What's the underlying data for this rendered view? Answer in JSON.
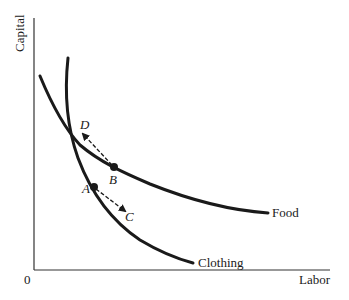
{
  "diagram": {
    "title": "",
    "y_axis_label": "Capital",
    "x_axis_label": "Labor",
    "origin_label": "0",
    "curves": [
      {
        "name": "Clothing",
        "label": "Clothing"
      },
      {
        "name": "Food",
        "label": "Food"
      }
    ],
    "points": [
      {
        "id": "A",
        "label": "A",
        "on_curve": "Clothing"
      },
      {
        "id": "B",
        "label": "B",
        "on_curve": "Food"
      }
    ],
    "arrow_targets": [
      {
        "id": "C",
        "label": "C",
        "from": "A",
        "style": "dashed"
      },
      {
        "id": "D",
        "label": "D",
        "from": "B",
        "style": "dashed"
      }
    ],
    "colors": {
      "ink": "#1a1a1a",
      "background": "#ffffff"
    }
  }
}
